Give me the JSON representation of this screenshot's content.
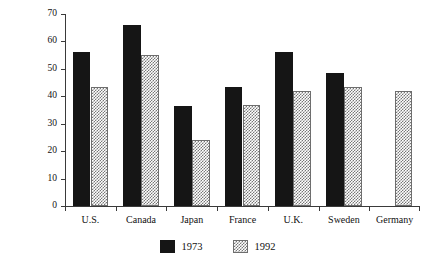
{
  "chart_data": {
    "type": "bar",
    "title": "",
    "xlabel": "",
    "ylabel": "(thousand tons oil equivalent per $1 million of GDP, at 1985 prices and exchange rates)",
    "ylabel_line1": "(thousand tons oil equivalent per $1 million of",
    "ylabel_line2": "GDP, at 1985 prices and exchange rates)",
    "categories": [
      "U.S.",
      "Canada",
      "Japan",
      "France",
      "U.K.",
      "Sweden",
      "Germany"
    ],
    "series": [
      {
        "name": "1973",
        "values": [
          56,
          66,
          36.5,
          43.5,
          56,
          48.5,
          null
        ]
      },
      {
        "name": "1992",
        "values": [
          43.5,
          55,
          24,
          37,
          42,
          43.5,
          42
        ]
      }
    ],
    "ylim": [
      0,
      70
    ],
    "yticks": [
      0,
      10,
      20,
      30,
      40,
      50,
      60,
      70
    ],
    "ytick_labels": [
      "0",
      "10",
      "20",
      "30",
      "40",
      "50",
      "60",
      "70"
    ],
    "grid": false,
    "legend_position": "bottom-center",
    "colors": {
      "series_1973": "#151515",
      "series_1992": "#777777",
      "axis": "#3a3a3a"
    }
  },
  "legend": {
    "items": [
      {
        "label": "1973",
        "style": "dark"
      },
      {
        "label": "1992",
        "style": "light"
      }
    ]
  }
}
